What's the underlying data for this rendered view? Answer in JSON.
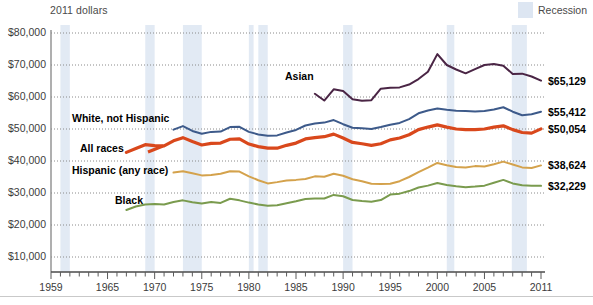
{
  "axis_unit_note": "2011 dollars",
  "legend": {
    "recession_label": "Recession",
    "recession_color": "#dde6f2"
  },
  "y_axis": {
    "ticks": [
      "$80,000",
      "$70,000",
      "$60,000",
      "$50,000",
      "$40,000",
      "$30,000",
      "$20,000",
      "$10,000"
    ]
  },
  "x_axis": {
    "ticks": [
      "1959",
      "1965",
      "1970",
      "1975",
      "1980",
      "1985",
      "1990",
      "1995",
      "2000",
      "2005",
      "2011"
    ]
  },
  "series_labels": [
    {
      "name": "Asian",
      "text": "Asian",
      "color": "#4a2545"
    },
    {
      "name": "White, not Hispanic",
      "text": "White, not Hispanic",
      "color": "#3d5a8a"
    },
    {
      "name": "All races",
      "text": "All races",
      "color": "#d9481c"
    },
    {
      "name": "Hispanic (any race)",
      "text": "Hispanic (any race)",
      "color": "#d4a24c"
    },
    {
      "name": "Black",
      "text": "Black",
      "color": "#7a9b4e"
    }
  ],
  "end_labels": [
    {
      "name": "Asian",
      "text": "$65,129"
    },
    {
      "name": "White, not Hispanic",
      "text": "$55,412"
    },
    {
      "name": "All races",
      "text": "$50,054"
    },
    {
      "name": "Hispanic (any race)",
      "text": "$38,624"
    },
    {
      "name": "Black",
      "text": "$32,229"
    }
  ],
  "chart_data": {
    "type": "line",
    "title": "",
    "subtitle": "",
    "xlabel": "",
    "ylabel": "2011 dollars",
    "xlim": [
      1959,
      2011
    ],
    "ylim": [
      0,
      80000
    ],
    "grid": true,
    "legend_position": "inline-labels",
    "y_tick_values": [
      10000,
      20000,
      30000,
      40000,
      50000,
      60000,
      70000,
      80000
    ],
    "x_tick_values": [
      1959,
      1965,
      1970,
      1975,
      1980,
      1985,
      1990,
      1995,
      2000,
      2005,
      2011
    ],
    "recession_bands": [
      [
        1960,
        1961
      ],
      [
        1969,
        1970
      ],
      [
        1973,
        1975
      ],
      [
        1980,
        1980.5
      ],
      [
        1981,
        1982
      ],
      [
        1990,
        1991
      ],
      [
        2001,
        2001.8
      ],
      [
        2007.9,
        2009.5
      ]
    ],
    "series": [
      {
        "name": "Asian",
        "color": "#4a2545",
        "line_width": 2,
        "end_value": 65129,
        "x": [
          1987,
          1988,
          1989,
          1990,
          1991,
          1992,
          1993,
          1994,
          1995,
          1996,
          1997,
          1998,
          1999,
          2000,
          2001,
          2002,
          2003,
          2004,
          2005,
          2006,
          2007,
          2008,
          2009,
          2010,
          2011
        ],
        "values": [
          61000,
          58900,
          62400,
          61900,
          59300,
          58800,
          59000,
          62600,
          62900,
          63000,
          63900,
          65600,
          67900,
          73400,
          70000,
          68600,
          67400,
          68700,
          70000,
          70300,
          69800,
          67200,
          67300,
          66400,
          65129
        ]
      },
      {
        "name": "White, not Hispanic",
        "color": "#3d5a8a",
        "line_width": 2,
        "end_value": 55412,
        "x": [
          1972,
          1973,
          1974,
          1975,
          1976,
          1977,
          1978,
          1979,
          1980,
          1981,
          1982,
          1983,
          1984,
          1985,
          1986,
          1987,
          1988,
          1989,
          1990,
          1991,
          1992,
          1993,
          1994,
          1995,
          1996,
          1997,
          1998,
          1999,
          2000,
          2001,
          2002,
          2003,
          2004,
          2005,
          2006,
          2007,
          2008,
          2009,
          2010,
          2011
        ],
        "values": [
          49800,
          50900,
          49400,
          48500,
          49100,
          49200,
          50600,
          50700,
          49100,
          48300,
          47900,
          48000,
          48900,
          49700,
          51100,
          51700,
          52000,
          52800,
          51500,
          50400,
          50200,
          50000,
          50600,
          51300,
          51900,
          53100,
          54900,
          55800,
          56400,
          56000,
          55700,
          55600,
          55500,
          55600,
          56100,
          56800,
          55400,
          54300,
          54600,
          55412
        ]
      },
      {
        "name": "All races",
        "color": "#d9481c",
        "line_width": 3.2,
        "end_value": 50054,
        "x": [
          1967,
          1968,
          1969,
          1970,
          1971,
          1972,
          1973,
          1974,
          1975,
          1976,
          1977,
          1978,
          1979,
          1980,
          1981,
          1982,
          1983,
          1984,
          1985,
          1986,
          1987,
          1988,
          1989,
          1990,
          1991,
          1992,
          1993,
          1994,
          1995,
          1996,
          1997,
          1998,
          1999,
          2000,
          2001,
          2002,
          2003,
          2004,
          2005,
          2006,
          2007,
          2008,
          2009,
          2010,
          2011
        ],
        "values": [
          42700,
          43900,
          45100,
          44800,
          44700,
          46300,
          47300,
          46100,
          45000,
          45500,
          45600,
          46800,
          46900,
          45300,
          44500,
          44000,
          44000,
          44900,
          45600,
          46900,
          47300,
          47600,
          48400,
          47200,
          45800,
          45400,
          44900,
          45400,
          46600,
          47200,
          48200,
          49800,
          50600,
          51300,
          50600,
          50000,
          49800,
          49800,
          50000,
          50600,
          51000,
          49800,
          48900,
          48700,
          50054
        ]
      },
      {
        "name": "Hispanic (any race)",
        "color": "#d4a24c",
        "line_width": 2,
        "end_value": 38624,
        "x": [
          1972,
          1973,
          1974,
          1975,
          1976,
          1977,
          1978,
          1979,
          1980,
          1981,
          1982,
          1983,
          1984,
          1985,
          1986,
          1987,
          1988,
          1989,
          1990,
          1991,
          1992,
          1993,
          1994,
          1995,
          1996,
          1997,
          1998,
          1999,
          2000,
          2001,
          2002,
          2003,
          2004,
          2005,
          2006,
          2007,
          2008,
          2009,
          2010,
          2011
        ],
        "values": [
          36400,
          36800,
          36200,
          35500,
          35600,
          36000,
          36800,
          36700,
          35200,
          34000,
          33000,
          33400,
          33900,
          34100,
          34400,
          35200,
          35100,
          36000,
          35400,
          34300,
          33700,
          32900,
          32800,
          32900,
          33700,
          35000,
          36500,
          37900,
          39400,
          38700,
          38100,
          38000,
          38400,
          38300,
          39000,
          39800,
          38900,
          38000,
          37800,
          38624
        ]
      },
      {
        "name": "Black",
        "color": "#7a9b4e",
        "line_width": 2,
        "end_value": 32229,
        "x": [
          1967,
          1968,
          1969,
          1970,
          1971,
          1972,
          1973,
          1974,
          1975,
          1976,
          1977,
          1978,
          1979,
          1980,
          1981,
          1982,
          1983,
          1984,
          1985,
          1986,
          1987,
          1988,
          1989,
          1990,
          1991,
          1992,
          1993,
          1994,
          1995,
          1996,
          1997,
          1998,
          1999,
          2000,
          2001,
          2002,
          2003,
          2004,
          2005,
          2006,
          2007,
          2008,
          2009,
          2010,
          2011
        ],
        "values": [
          24700,
          25800,
          26400,
          26600,
          26400,
          27200,
          27700,
          27100,
          26700,
          27200,
          26900,
          28200,
          27700,
          27000,
          26400,
          26000,
          26200,
          26800,
          27400,
          28100,
          28300,
          28300,
          29400,
          29000,
          27800,
          27500,
          27300,
          27800,
          29500,
          29800,
          30600,
          31700,
          32300,
          33100,
          32500,
          32100,
          31800,
          32000,
          32300,
          33200,
          34100,
          33000,
          32400,
          32300,
          32229
        ]
      }
    ]
  }
}
